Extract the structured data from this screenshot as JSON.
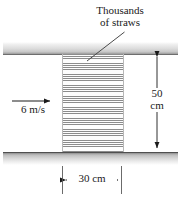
{
  "figure": {
    "background_color": "#ffffff",
    "wall_color": "#9a9a9a",
    "line_color": "#1a1a1a"
  },
  "callout": {
    "line1": "Thousands",
    "line2": "of straws"
  },
  "inlet": {
    "velocity_label": "6 m/s"
  },
  "dimensions": {
    "height": {
      "value": "50",
      "unit": "cm"
    },
    "width": {
      "label": "30 cm"
    }
  }
}
